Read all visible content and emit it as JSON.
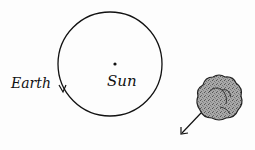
{
  "diagram": {
    "labels": {
      "earth": "Earth",
      "sun": "Sun"
    },
    "elements": [
      {
        "name": "orbit",
        "shape": "circle",
        "direction": "counterclockwise-arrow"
      },
      {
        "name": "sun",
        "shape": "dot"
      },
      {
        "name": "cloud",
        "shape": "nebula-blob",
        "motion": "down-left-arrow"
      }
    ],
    "colors": {
      "line": "#111111",
      "cloud_fill": "#9a9a9a",
      "background": "#fdfdfd"
    }
  }
}
